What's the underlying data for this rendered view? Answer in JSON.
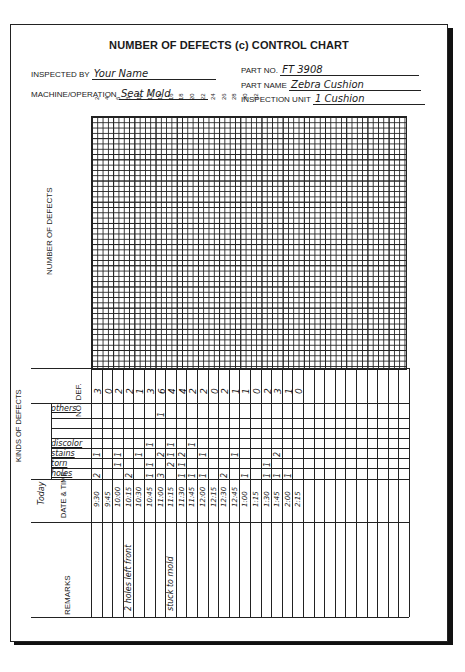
{
  "form": {
    "title": "NUMBER OF DEFECTS (c) CONTROL CHART",
    "inspected_by_label": "INSPECTED BY",
    "inspected_by": "Your Name",
    "machine_label": "MACHINE/OPERATION",
    "machine": "Seat Mold",
    "part_no_label": "PART NO.",
    "part_no": "FT 3908",
    "part_name_label": "PART NAME",
    "part_name": "Zebra Cushion",
    "inspection_unit_label": "INSPECTION UNIT",
    "inspection_unit": "1 Cushion"
  },
  "chart": {
    "ylabel": "NUMBER OF DEFECTS",
    "column_ticks": [
      "2",
      "4",
      "6",
      "8",
      "10",
      "12",
      "14",
      "16",
      "18",
      "20",
      "22",
      "24",
      "26",
      "28",
      "30",
      "32"
    ]
  },
  "labels": {
    "no_def": "NO. DEF.",
    "kinds": "KINDS OF DEFECTS",
    "today": "Today",
    "date_time": "DATE & TIME",
    "remarks": "REMARKS"
  },
  "kinds": [
    "others",
    "",
    "",
    "discolor",
    "stains",
    "torn",
    "holes"
  ],
  "chart_data": {
    "type": "table",
    "title": "NUMBER OF DEFECTS (c) CONTROL CHART",
    "columns": [
      "9:30",
      "9:45",
      "10:00",
      "10:15",
      "10:30",
      "10:45",
      "11:00",
      "11:15",
      "11:30",
      "11:45",
      "12:00",
      "12:15",
      "12:30",
      "12:45",
      "1:00",
      "1:15",
      "1:30",
      "1:45",
      "2:00",
      "2:15"
    ],
    "no_def": [
      "3",
      "0",
      "2",
      "2",
      "1",
      "3",
      "6",
      "4",
      "4",
      "2",
      "2",
      "0",
      "2",
      "1",
      "1",
      "0",
      "2",
      "3",
      "1",
      "0"
    ],
    "rows": {
      "others": [
        "",
        "",
        "",
        "",
        "",
        "",
        "1",
        "",
        "",
        "",
        "",
        "",
        "",
        "",
        "",
        "",
        "",
        "",
        "",
        ""
      ],
      "blank1": [
        "",
        "",
        "",
        "",
        "",
        "",
        "",
        "",
        "",
        "",
        "",
        "",
        "",
        "",
        "",
        "",
        "",
        "",
        "",
        ""
      ],
      "blank2": [
        "",
        "",
        "",
        "",
        "",
        "",
        "",
        "",
        "",
        "",
        "",
        "",
        "",
        "",
        "",
        "",
        "",
        "",
        "",
        ""
      ],
      "discolor": [
        "",
        "",
        "",
        "",
        "",
        "1",
        "",
        "1",
        "",
        "1",
        "",
        "",
        "",
        "",
        "",
        "",
        "",
        "",
        "",
        ""
      ],
      "stains": [
        "1",
        "",
        "1",
        "",
        "1",
        "",
        "2",
        "1",
        "2",
        "",
        "1",
        "",
        "",
        "1",
        "",
        "",
        "",
        "2",
        "",
        ""
      ],
      "torn": [
        "",
        "",
        "1",
        "",
        "",
        "1",
        "",
        "2",
        "1",
        "",
        "",
        "",
        "",
        "",
        "",
        "",
        "1",
        "",
        "",
        ""
      ],
      "holes": [
        "2",
        "",
        "",
        "2",
        "",
        "1",
        "3",
        "",
        "1",
        "1",
        "1",
        "",
        "2",
        "",
        "1",
        "",
        "1",
        "1",
        "1",
        ""
      ]
    },
    "remarks": [
      "",
      "",
      "",
      "2 holes left front",
      "",
      "",
      "",
      "stuck to mold",
      "",
      "",
      "",
      "",
      "",
      "",
      "",
      "",
      "",
      "",
      "",
      ""
    ]
  }
}
